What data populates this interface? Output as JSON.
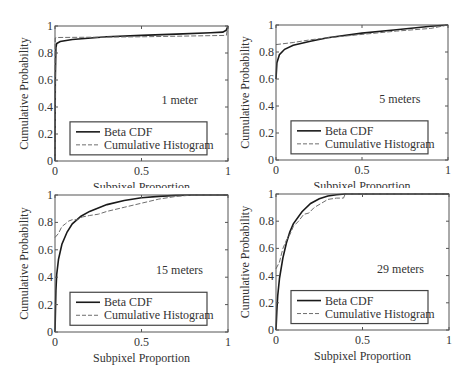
{
  "figure": {
    "layout": "2x2 grid",
    "legend_labels": [
      "Beta CDF",
      "Cumulative Histogram"
    ]
  },
  "chart_data": [
    {
      "type": "line",
      "title": "",
      "annotation": "1 meter",
      "xlabel": "Subpixel Proportion",
      "ylabel": "Cumulative Probability",
      "xlim": [
        0,
        1
      ],
      "ylim": [
        0,
        1
      ],
      "xticks": [
        "0",
        "0.5",
        "1"
      ],
      "yticks": [
        "0",
        "0.2",
        "0.4",
        "0.6",
        "0.8",
        "1"
      ],
      "grid": false,
      "legend_position": "lower center",
      "series": [
        {
          "name": "Beta CDF",
          "style": "solid",
          "x": [
            0,
            0.002,
            0.005,
            0.01,
            0.03,
            0.1,
            0.3,
            0.5,
            0.7,
            0.9,
            0.97,
            0.99,
            1.0
          ],
          "y": [
            0,
            0.6,
            0.84,
            0.87,
            0.885,
            0.9,
            0.92,
            0.93,
            0.94,
            0.95,
            0.955,
            0.97,
            1.0
          ]
        },
        {
          "name": "Cumulative Histogram",
          "style": "dashed",
          "x": [
            0,
            0.001,
            0.01,
            0.5,
            0.99,
            1.0
          ],
          "y": [
            0,
            0.91,
            0.915,
            0.92,
            0.93,
            1.0
          ]
        }
      ]
    },
    {
      "type": "line",
      "title": "",
      "annotation": "5 meters",
      "xlabel": "Subpixel Proportion",
      "ylabel": "Cumulative Probability",
      "xlim": [
        0,
        1
      ],
      "ylim": [
        0,
        1
      ],
      "xticks": [
        "0",
        "0.5",
        "1"
      ],
      "yticks": [
        "0",
        "0.2",
        "0.4",
        "0.6",
        "0.8",
        "1"
      ],
      "grid": false,
      "legend_position": "lower center",
      "series": [
        {
          "name": "Beta CDF",
          "style": "solid",
          "x": [
            0,
            0.005,
            0.02,
            0.05,
            0.1,
            0.2,
            0.3,
            0.5,
            0.7,
            0.9,
            1.0
          ],
          "y": [
            0.6,
            0.72,
            0.78,
            0.82,
            0.85,
            0.88,
            0.905,
            0.94,
            0.965,
            0.99,
            1.0
          ]
        },
        {
          "name": "Cumulative Histogram",
          "style": "dashed",
          "x": [
            0,
            0.1,
            0.2,
            0.3,
            0.5,
            0.7,
            0.9,
            1.0
          ],
          "y": [
            0.855,
            0.87,
            0.89,
            0.905,
            0.93,
            0.955,
            0.975,
            1.0
          ]
        }
      ]
    },
    {
      "type": "line",
      "title": "",
      "annotation": "15 meters",
      "xlabel": "Subpixel Proportion",
      "ylabel": "Cumulative Probability",
      "xlim": [
        0,
        1
      ],
      "ylim": [
        0,
        1
      ],
      "xticks": [
        "0",
        "0.5",
        "1"
      ],
      "yticks": [
        "0",
        "0.2",
        "0.4",
        "0.6",
        "0.8",
        "1"
      ],
      "grid": false,
      "legend_position": "lower center",
      "series": [
        {
          "name": "Beta CDF",
          "style": "solid",
          "x": [
            0,
            0.005,
            0.01,
            0.02,
            0.04,
            0.07,
            0.1,
            0.15,
            0.2,
            0.3,
            0.4,
            0.5,
            0.6,
            0.7,
            0.8,
            1.0
          ],
          "y": [
            0,
            0.3,
            0.42,
            0.53,
            0.64,
            0.73,
            0.79,
            0.845,
            0.88,
            0.93,
            0.96,
            0.98,
            0.99,
            0.997,
            1.0,
            1.0
          ]
        },
        {
          "name": "Cumulative Histogram",
          "style": "dashed",
          "x": [
            0,
            0.02,
            0.04,
            0.06,
            0.08,
            0.1,
            0.13,
            0.16,
            0.2,
            0.25,
            0.3,
            0.4,
            0.5,
            0.6,
            0.7,
            0.8,
            1.0
          ],
          "y": [
            0.69,
            0.72,
            0.77,
            0.79,
            0.81,
            0.82,
            0.82,
            0.84,
            0.85,
            0.86,
            0.88,
            0.91,
            0.94,
            0.97,
            0.99,
            1.0,
            1.0
          ]
        }
      ]
    },
    {
      "type": "line",
      "title": "",
      "annotation": "29 meters",
      "xlabel": "Subpixel Proportion",
      "ylabel": "Cumulative Probability",
      "xlim": [
        0,
        1
      ],
      "ylim": [
        0,
        1
      ],
      "xticks": [
        "0",
        "0.5",
        "1"
      ],
      "yticks": [
        "0",
        "0.2",
        "0.4",
        "0.6",
        "0.8",
        "1"
      ],
      "grid": false,
      "legend_position": "lower center",
      "series": [
        {
          "name": "Beta CDF",
          "style": "solid",
          "x": [
            0,
            0.005,
            0.01,
            0.02,
            0.04,
            0.06,
            0.08,
            0.1,
            0.15,
            0.2,
            0.25,
            0.3,
            0.35,
            0.4,
            0.5,
            1.0
          ],
          "y": [
            0,
            0.15,
            0.25,
            0.38,
            0.53,
            0.64,
            0.72,
            0.78,
            0.87,
            0.93,
            0.965,
            0.985,
            0.995,
            1.0,
            1.0,
            1.0
          ]
        },
        {
          "name": "Cumulative Histogram",
          "style": "dashed",
          "x": [
            0,
            0.02,
            0.04,
            0.06,
            0.08,
            0.1,
            0.13,
            0.16,
            0.19,
            0.22,
            0.26,
            0.3,
            0.35,
            0.39,
            0.4,
            0.5,
            1.0
          ],
          "y": [
            0.45,
            0.5,
            0.6,
            0.66,
            0.7,
            0.76,
            0.8,
            0.85,
            0.86,
            0.9,
            0.93,
            0.96,
            0.97,
            0.97,
            1.0,
            1.0,
            1.0
          ]
        }
      ]
    }
  ]
}
